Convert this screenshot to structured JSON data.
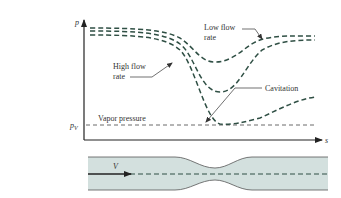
{
  "diagram": {
    "axes": {
      "y_label": "p",
      "x_label": "s",
      "vapor_level_label": "p",
      "vapor_level_subscript": "V"
    },
    "labels": {
      "low_flow_line1": "Low flow",
      "low_flow_line2": "rate",
      "high_flow_line1": "High flow",
      "high_flow_line2": "rate",
      "cavitation": "Cavitation",
      "vapor_pressure": "Vapor pressure"
    },
    "pipe": {
      "velocity_label": "V"
    },
    "colors": {
      "curve": "#2f4f44",
      "axis": "#222222",
      "pipe_fill": "#d3e0de",
      "pipe_edge": "#555555"
    }
  }
}
